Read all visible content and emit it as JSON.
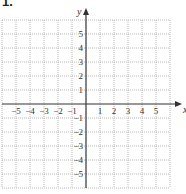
{
  "problem": {
    "label": "1."
  },
  "chart_data": {
    "type": "scatter",
    "title": "",
    "xlabel": "x",
    "ylabel": "y",
    "xlim": [
      -6,
      6
    ],
    "ylim": [
      -6,
      6
    ],
    "grid": true,
    "grid_style": "dotted",
    "x_ticks": [
      -5,
      -4,
      -3,
      -2,
      -1,
      1,
      2,
      3,
      4,
      5
    ],
    "y_ticks": [
      5,
      4,
      3,
      2,
      1,
      -1,
      -2,
      -3,
      -4,
      -5
    ],
    "x_tick_labels": [
      "−5",
      "−4",
      "−3",
      "−2",
      "−1",
      "1",
      "2",
      "3",
      "4",
      "5"
    ],
    "y_tick_labels": [
      "5",
      "4",
      "3",
      "2",
      "1",
      "−1",
      "−2",
      "−3",
      "−4",
      "−5"
    ],
    "series": [],
    "legend": null
  },
  "colors": {
    "grid": "#b8b8b8",
    "axis": "#333333",
    "text": "#333333"
  }
}
